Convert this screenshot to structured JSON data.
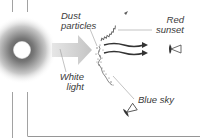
{
  "diagram": {
    "labels": {
      "dust_line1": "Dust",
      "dust_line2": "particles",
      "red_line1": "Red",
      "red_line2": "sunset",
      "white_line1": "White",
      "white_line2": "light",
      "blue": "Blue sky"
    },
    "elements": {
      "sun": "sun-glow",
      "incoming_arrow": "white-light-arrow",
      "dust_layer": "dust-particle-layer",
      "scattered_wave": "scattered-blue-wave",
      "transmitted_rays": "red-transmitted-rays",
      "observer_right": "eye-observer-sunset",
      "observer_bottom": "eye-observer-sky"
    },
    "colors": {
      "line": "#8a8a8a",
      "glow_inner": "#7a7a7a",
      "arrow": "#cfcfcf",
      "ray": "#3c3c3c",
      "text": "#3a3a3a"
    }
  }
}
